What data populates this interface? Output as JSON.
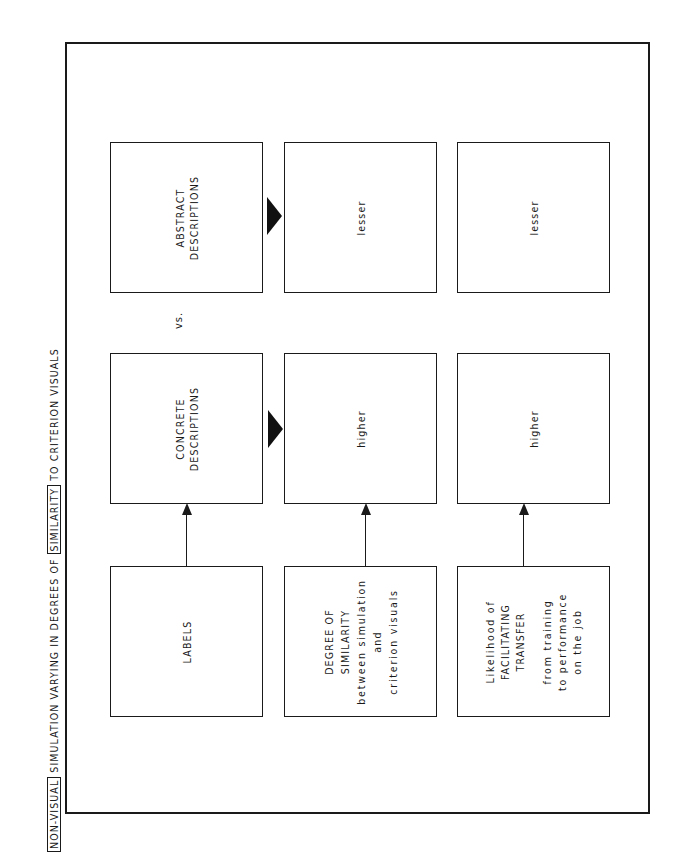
{
  "title": {
    "parts": [
      {
        "text": "NON-VISUAL",
        "boxed": true
      },
      {
        "text": " SIMULATION VARYING IN DEGREES OF ",
        "boxed": false
      },
      {
        "text": "SIMILARITY",
        "boxed": true
      },
      {
        "text": " TO CRITERION VISUALS",
        "boxed": false
      }
    ]
  },
  "rows": {
    "labels": {
      "name": "LABELS",
      "concrete": "CONCRETE DESCRIPTIONS",
      "concrete_lines": [
        "CONCRETE",
        "DESCRIPTIONS"
      ],
      "abstract_lines": [
        "ABSTRACT",
        "DESCRIPTIONS"
      ],
      "vs": "vs."
    },
    "similarity": {
      "lines": [
        "DEGREE OF",
        "SIMILARITY",
        "between simulation",
        "and",
        "criterion visuals"
      ],
      "concrete_value": "higher",
      "abstract_value": "lesser"
    },
    "transfer": {
      "lines": [
        "Likelihood of",
        "FACILITATING",
        "TRANSFER",
        "",
        "from training",
        "to performance",
        "on the job"
      ],
      "concrete_value": "higher",
      "abstract_value": "lesser"
    }
  },
  "colors": {
    "ink": "#1a1a1a",
    "paper": "#ffffff"
  }
}
